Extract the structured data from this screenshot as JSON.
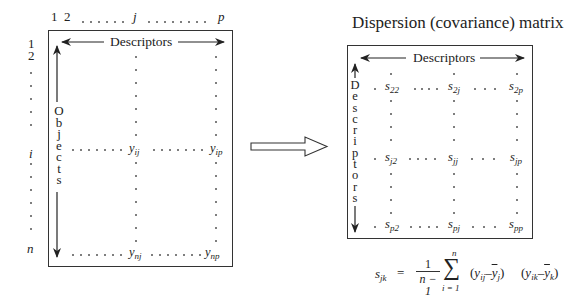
{
  "left_matrix": {
    "col_headers": [
      "1",
      "2",
      "j",
      "p"
    ],
    "row_headers": [
      "1",
      "2",
      "i",
      "n"
    ],
    "top_label": "Descriptors",
    "side_label": "Objects",
    "side_letters": [
      "O",
      "b",
      "j",
      "e",
      "c",
      "t",
      "s"
    ],
    "cells": {
      "yij": {
        "base": "y",
        "sub": "ij"
      },
      "yip": {
        "base": "y",
        "sub": "ip"
      },
      "ynj": {
        "base": "y",
        "sub": "nj"
      },
      "ynp": {
        "base": "y",
        "sub": "np"
      }
    }
  },
  "arrow": {
    "icon": "hollow-right-arrow-icon"
  },
  "right_matrix": {
    "title": "Dispersion (covariance) matrix",
    "top_label": "Descriptors",
    "side_label": "Descriptors",
    "side_letters": [
      "D",
      "e",
      "s",
      "c",
      "r",
      "i",
      "p",
      "t",
      "o",
      "r",
      "s"
    ],
    "cells": {
      "s22": {
        "base": "s",
        "sub": "22"
      },
      "s2j": {
        "base": "s",
        "sub": "2j"
      },
      "s2p": {
        "base": "s",
        "sub": "2p"
      },
      "sj2": {
        "base": "s",
        "sub": "j2"
      },
      "sjj": {
        "base": "s",
        "sub": "jj"
      },
      "sjp": {
        "base": "s",
        "sub": "jp"
      },
      "sp2": {
        "base": "s",
        "sub": "p2"
      },
      "spj": {
        "base": "s",
        "sub": "pj"
      },
      "spp": {
        "base": "s",
        "sub": "pp"
      }
    }
  },
  "formula": {
    "lhs_base": "s",
    "lhs_sub": "jk",
    "equals": "=",
    "frac_num": "1",
    "frac_den": "n − 1",
    "sum_symbol": "∑",
    "sum_upper": "n",
    "sum_lower": "i = 1",
    "term1": {
      "open": "(",
      "y": "y",
      "y_sub": "ij",
      "minus": "–",
      "ybar": "y",
      "ybar_sub": "j",
      "close": ")"
    },
    "term2": {
      "open": "(",
      "y": "y",
      "y_sub": "ik",
      "minus": "–",
      "ybar": "y",
      "ybar_sub": "k",
      "close": ")"
    }
  }
}
